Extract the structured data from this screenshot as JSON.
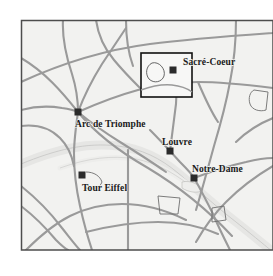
{
  "figure": {
    "background_color": "#ffffff",
    "map_fill_color": "#f2f2f0",
    "frame_color": "#4d4d4d",
    "road_color": "#9a9a9a",
    "river_color": "#e2e2e0",
    "river_edge_color": "#b4b4b2",
    "marker_color": "#2b2b2b",
    "label_color": "#1a1a1a",
    "inset_box_color": "#111111"
  },
  "map": {
    "frame": {
      "x": 21,
      "y": 20,
      "width": 252,
      "height": 230
    },
    "inset_box": {
      "x": 141,
      "y": 53,
      "width": 51,
      "height": 44
    },
    "landmarks": [
      {
        "name": "Sacré-Coeur",
        "marker_x": 173,
        "marker_y": 70,
        "label_x": 183,
        "label_y": 57
      },
      {
        "name": "Arc de Triomphe",
        "marker_x": 78,
        "marker_y": 112,
        "label_x": 75,
        "label_y": 119
      },
      {
        "name": "Louvre",
        "marker_x": 170,
        "marker_y": 151,
        "label_x": 162,
        "label_y": 137
      },
      {
        "name": "Notre-Dame",
        "marker_x": 194,
        "marker_y": 178,
        "label_x": 192,
        "label_y": 164
      },
      {
        "name": "Tour Eiffel",
        "marker_x": 82,
        "marker_y": 175,
        "label_x": 82,
        "label_y": 183
      }
    ],
    "marker_size": 7
  }
}
